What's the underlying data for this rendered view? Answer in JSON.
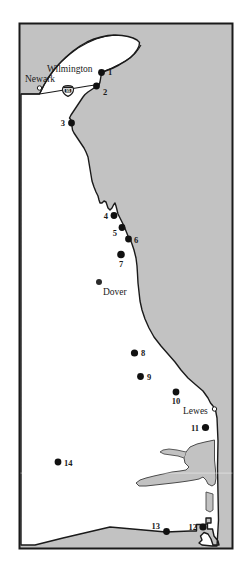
{
  "figure": {
    "width": 251,
    "height": 574
  },
  "colors": {
    "water": "#c2c2c2",
    "land": "#ffffff",
    "outline": "#1a1a1a",
    "frame": "#1a1a1a",
    "marker": "#111111",
    "label": "#1a1a1a",
    "background": "#ffffff"
  },
  "legend_note": "Filled circles mark numbered sampling sites 1-14; open circles mark reference cities.",
  "cities": [
    {
      "name": "Wilmington",
      "label": "Wilmington",
      "marker": "filled-circle",
      "label_x": 47,
      "label_y": 72,
      "anchor": "start"
    },
    {
      "name": "Newark",
      "label": "Newark",
      "marker": "open-circle",
      "marker_x": 39.5,
      "marker_y": 88,
      "label_x": 25,
      "label_y": 82,
      "anchor": "start"
    },
    {
      "name": "Dover",
      "label": "Dover",
      "marker": "filled-circle",
      "marker_x": 99,
      "marker_y": 282,
      "label_x": 103,
      "label_y": 295,
      "anchor": "start"
    },
    {
      "name": "Lewes",
      "label": "Lewes",
      "marker": "open-circle",
      "marker_x": 214.5,
      "marker_y": 409,
      "label_x": 183,
      "label_y": 414,
      "anchor": "start"
    }
  ],
  "highways": [
    {
      "name": "interstate-95",
      "shield_label": "95",
      "shield_x": 68,
      "shield_y": 92
    }
  ],
  "sites": [
    {
      "id": "1",
      "x": 101.5,
      "y": 72.5,
      "label_x": 108,
      "label_y": 75,
      "anchor": "start"
    },
    {
      "id": "2",
      "x": 96.5,
      "y": 86.0,
      "label_x": 103,
      "label_y": 95,
      "anchor": "start"
    },
    {
      "id": "3",
      "x": 71.5,
      "y": 123.0,
      "label_x": 65,
      "label_y": 126,
      "anchor": "end"
    },
    {
      "id": "4",
      "x": 114.0,
      "y": 215.5,
      "label_x": 108,
      "label_y": 219,
      "anchor": "end"
    },
    {
      "id": "5",
      "x": 122.0,
      "y": 227.5,
      "label_x": 117,
      "label_y": 236,
      "anchor": "end"
    },
    {
      "id": "6",
      "x": 128.5,
      "y": 239.0,
      "label_x": 134,
      "label_y": 243,
      "anchor": "start"
    },
    {
      "id": "7",
      "x": 121.0,
      "y": 254.5,
      "label_x": 121,
      "label_y": 267,
      "anchor": "middle"
    },
    {
      "id": "8",
      "x": 134.5,
      "y": 353.0,
      "label_x": 141,
      "label_y": 356,
      "anchor": "start"
    },
    {
      "id": "9",
      "x": 140.5,
      "y": 376.5,
      "label_x": 147,
      "label_y": 380,
      "anchor": "start"
    },
    {
      "id": "10",
      "x": 176.0,
      "y": 392.0,
      "label_x": 176,
      "label_y": 404,
      "anchor": "middle"
    },
    {
      "id": "11",
      "x": 205.5,
      "y": 427.5,
      "label_x": 199,
      "label_y": 431,
      "anchor": "end"
    },
    {
      "id": "12",
      "x": 203.0,
      "y": 527.0,
      "label_x": 197,
      "label_y": 530,
      "anchor": "end"
    },
    {
      "id": "13",
      "x": 166.5,
      "y": 531.5,
      "label_x": 160,
      "label_y": 529,
      "anchor": "end"
    },
    {
      "id": "14",
      "x": 58.0,
      "y": 462.0,
      "label_x": 64,
      "label_y": 466,
      "anchor": "start"
    }
  ]
}
